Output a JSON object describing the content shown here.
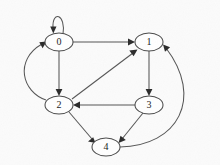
{
  "figure": {
    "kind": "directed-graph",
    "width": 220,
    "height": 165,
    "background_color": "#fbfbfb",
    "node_fill_color": "#ffffff",
    "node_stroke_color": "#4a4a4a",
    "edge_color": "#555555",
    "arrowhead_color": "#2b2b2b",
    "label_color": "#1a1a1a"
  },
  "nodes": [
    {
      "id": "0",
      "label": "0",
      "cx": 59,
      "cy": 42,
      "rx": 14,
      "ry": 9
    },
    {
      "id": "1",
      "label": "1",
      "cx": 149,
      "cy": 42,
      "rx": 14,
      "ry": 9
    },
    {
      "id": "2",
      "label": "2",
      "cx": 59,
      "cy": 105,
      "rx": 14,
      "ry": 9
    },
    {
      "id": "3",
      "label": "3",
      "cx": 149,
      "cy": 105,
      "rx": 14,
      "ry": 9
    },
    {
      "id": "4",
      "label": "4",
      "cx": 106,
      "cy": 147,
      "rx": 14,
      "ry": 9
    }
  ],
  "edges": [
    {
      "id": "e0",
      "from": "0",
      "to": "0",
      "label": "0 to 0",
      "kind": "self-loop",
      "path": "M 63 34 C 66 14, 52 10, 53 28",
      "head": "53.3,33.5 50.2,26.6 56.5,26.4"
    },
    {
      "id": "e1",
      "from": "0",
      "to": "1",
      "label": "0 to 1",
      "kind": "straight",
      "path": "M 73 42 L 130 42",
      "head": "135,42 128,38.6 128,45.4"
    },
    {
      "id": "e2",
      "from": "0",
      "to": "2",
      "label": "0 to 2",
      "kind": "straight",
      "path": "M 59 51 L 59 91",
      "head": "59,96 55.6,89 62.4,89"
    },
    {
      "id": "e3",
      "from": "2",
      "to": "0",
      "label": "2 to 0",
      "kind": "curve-left",
      "path": "M 46 100 C 22 92, 14 60, 42 44",
      "head": "46.5,41.6 42.6,48.2 39.3,42.3"
    },
    {
      "id": "e4",
      "from": "2",
      "to": "1",
      "label": "2 to 1",
      "kind": "diagonal",
      "path": "M 72 99 L 133 53",
      "head": "137.5,49.6 133.6,56.2 129.3,50.5"
    },
    {
      "id": "e5",
      "from": "1",
      "to": "3",
      "label": "1 to 3",
      "kind": "straight",
      "path": "M 149 51 L 149 91",
      "head": "149,96 145.6,89 152.4,89"
    },
    {
      "id": "e6",
      "from": "3",
      "to": "2",
      "label": "3 to 2",
      "kind": "straight",
      "path": "M 135 105 L 78 105",
      "head": "73,105 80,101.6 80,108.4"
    },
    {
      "id": "e7",
      "from": "2",
      "to": "4",
      "label": "2 to 4",
      "kind": "diagonal",
      "path": "M 69 112 L 92 139",
      "head": "95.5,143 88,141.6 93.2,137.2"
    },
    {
      "id": "e8",
      "from": "3",
      "to": "4",
      "label": "3 to 4",
      "kind": "diagonal",
      "path": "M 143 113 L 122 139",
      "head": "118.5,143 120.5,135.7 125.8,140"
    },
    {
      "id": "e9",
      "from": "4",
      "to": "1",
      "label": "4 to 1",
      "kind": "curve-right",
      "path": "M 120 147 C 178 146, 204 98, 166 48",
      "head": "163,44.5 170.1,47.3 165,51.8"
    }
  ]
}
